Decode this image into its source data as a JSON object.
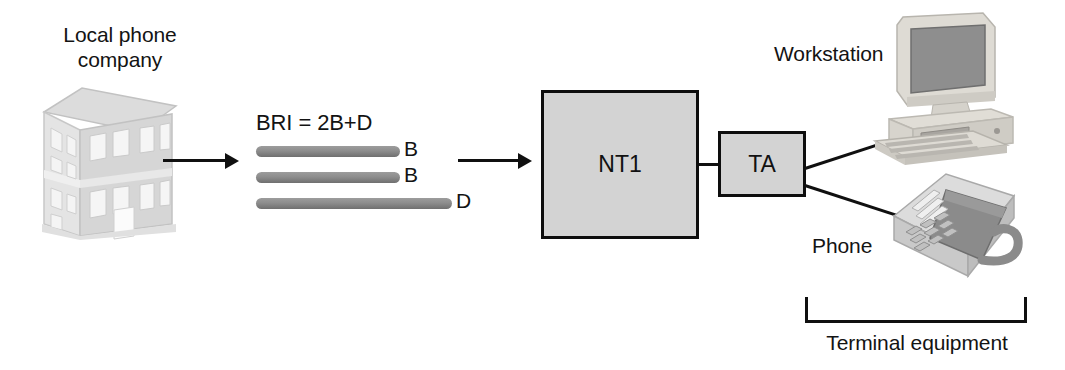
{
  "diagram": {
    "background_color": "#ffffff",
    "line_color": "#101010",
    "box_fill_color": "#d3d3d3",
    "channel_bar_color": "#8d8d8d"
  },
  "labels": {
    "local_phone_company": "Local phone\ncompany",
    "bri": "BRI = 2B+D",
    "workstation": "Workstation",
    "phone": "Phone",
    "terminal_equipment": "Terminal equipment"
  },
  "channels": [
    {
      "id": "b1",
      "label": "B",
      "type": "bearer"
    },
    {
      "id": "b2",
      "label": "B",
      "type": "bearer"
    },
    {
      "id": "d",
      "label": "D",
      "type": "data"
    }
  ],
  "nodes": [
    {
      "id": "nt1",
      "label": "NT1"
    },
    {
      "id": "ta",
      "label": "TA"
    }
  ],
  "icons": {
    "building": "office-building-icon",
    "workstation": "desktop-computer-icon",
    "phone": "desk-telephone-icon"
  }
}
